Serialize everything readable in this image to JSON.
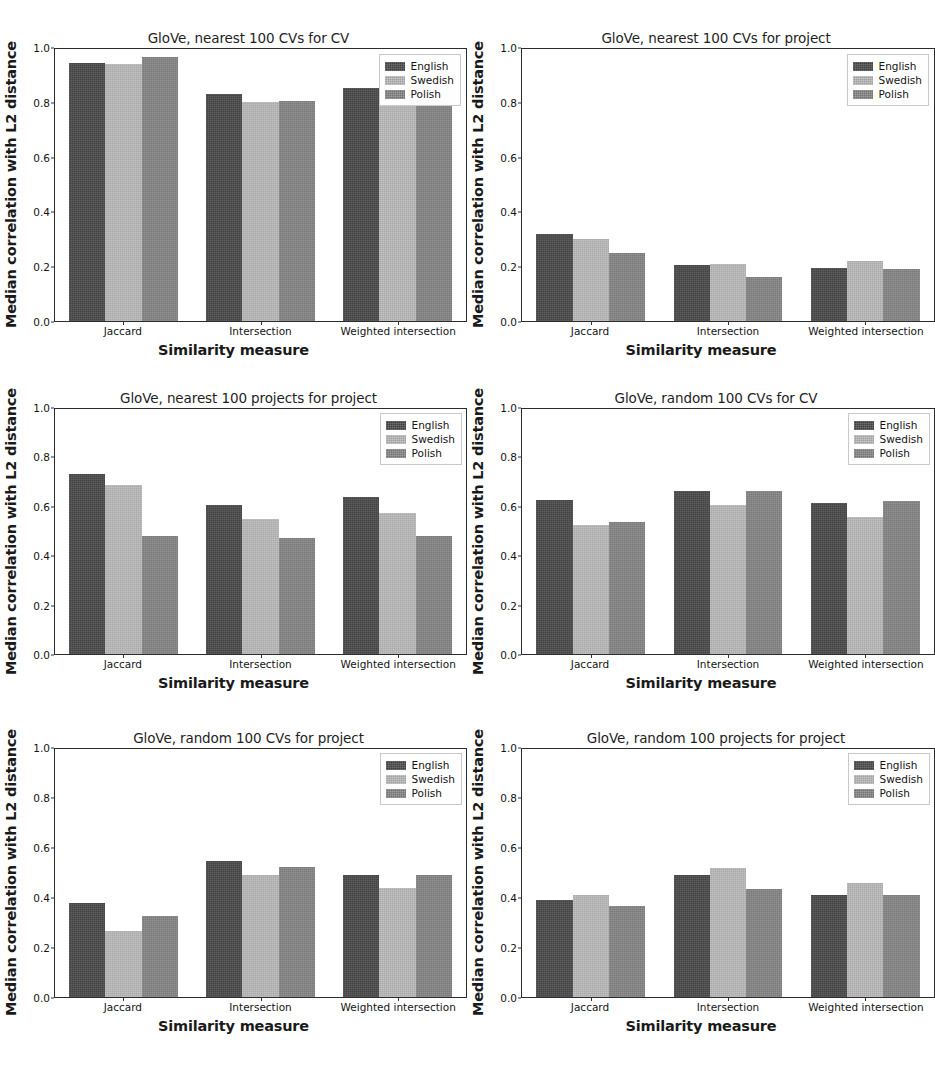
{
  "figure": {
    "shared_ylabel": "Median correlation with L2 distance",
    "shared_xlabel": "Similarity measure",
    "categories": [
      "Jaccard",
      "Intersection",
      "Weighted intersection"
    ],
    "series_names": [
      "English",
      "Swedish",
      "Polish"
    ],
    "yticks": [
      "0.0",
      "0.2",
      "0.4",
      "0.6",
      "0.8",
      "1.0"
    ],
    "colors": {
      "English": "#4a4a4a",
      "Swedish": "#b9b9b9",
      "Polish": "#858585",
      "axis": "#2c2c2c",
      "background": "#ffffff"
    }
  },
  "chart_data": [
    {
      "type": "bar",
      "title": "GloVe, nearest 100 CVs for CV",
      "xlabel": "Similarity measure",
      "ylabel": "Median correlation with L2 distance",
      "categories": [
        "Jaccard",
        "Intersection",
        "Weighted intersection"
      ],
      "series": [
        {
          "name": "English",
          "values": [
            0.95,
            0.835,
            0.855
          ]
        },
        {
          "name": "Swedish",
          "values": [
            0.945,
            0.805,
            0.825
          ]
        },
        {
          "name": "Polish",
          "values": [
            0.97,
            0.81,
            0.83
          ]
        }
      ],
      "ylim": [
        0.0,
        1.0
      ],
      "yticks": [
        0.0,
        0.2,
        0.4,
        0.6,
        0.8,
        1.0
      ],
      "grid": false,
      "legend_position": "upper right"
    },
    {
      "type": "bar",
      "title": "GloVe, nearest 100 CVs for project",
      "xlabel": "Similarity measure",
      "ylabel": "Median correlation with L2 distance",
      "categories": [
        "Jaccard",
        "Intersection",
        "Weighted intersection"
      ],
      "series": [
        {
          "name": "English",
          "values": [
            0.32,
            0.205,
            0.195
          ]
        },
        {
          "name": "Swedish",
          "values": [
            0.3,
            0.21,
            0.22
          ]
        },
        {
          "name": "Polish",
          "values": [
            0.25,
            0.16,
            0.19
          ]
        }
      ],
      "ylim": [
        0.0,
        1.0
      ],
      "yticks": [
        0.0,
        0.2,
        0.4,
        0.6,
        0.8,
        1.0
      ],
      "grid": false,
      "legend_position": "upper right"
    },
    {
      "type": "bar",
      "title": "GloVe, nearest 100 projects for project",
      "xlabel": "Similarity measure",
      "ylabel": "Median correlation with L2 distance",
      "categories": [
        "Jaccard",
        "Intersection",
        "Weighted intersection"
      ],
      "series": [
        {
          "name": "English",
          "values": [
            0.735,
            0.61,
            0.64
          ]
        },
        {
          "name": "Swedish",
          "values": [
            0.69,
            0.55,
            0.575
          ]
        },
        {
          "name": "Polish",
          "values": [
            0.48,
            0.475,
            0.48
          ]
        }
      ],
      "ylim": [
        0.0,
        1.0
      ],
      "yticks": [
        0.0,
        0.2,
        0.4,
        0.6,
        0.8,
        1.0
      ],
      "grid": false,
      "legend_position": "upper right"
    },
    {
      "type": "bar",
      "title": "GloVe, random 100 CVs for CV",
      "xlabel": "Similarity measure",
      "ylabel": "Median correlation with L2 distance",
      "categories": [
        "Jaccard",
        "Intersection",
        "Weighted intersection"
      ],
      "series": [
        {
          "name": "English",
          "values": [
            0.63,
            0.665,
            0.615
          ]
        },
        {
          "name": "Swedish",
          "values": [
            0.525,
            0.61,
            0.56
          ]
        },
        {
          "name": "Polish",
          "values": [
            0.54,
            0.665,
            0.625
          ]
        }
      ],
      "ylim": [
        0.0,
        1.0
      ],
      "yticks": [
        0.0,
        0.2,
        0.4,
        0.6,
        0.8,
        1.0
      ],
      "grid": false,
      "legend_position": "upper right"
    },
    {
      "type": "bar",
      "title": "GloVe, random 100 CVs for project",
      "xlabel": "Similarity measure",
      "ylabel": "Median correlation with L2 distance",
      "categories": [
        "Jaccard",
        "Intersection",
        "Weighted intersection"
      ],
      "series": [
        {
          "name": "English",
          "values": [
            0.38,
            0.55,
            0.49
          ]
        },
        {
          "name": "Swedish",
          "values": [
            0.265,
            0.49,
            0.44
          ]
        },
        {
          "name": "Polish",
          "values": [
            0.325,
            0.525,
            0.49
          ]
        }
      ],
      "ylim": [
        0.0,
        1.0
      ],
      "yticks": [
        0.0,
        0.2,
        0.4,
        0.6,
        0.8,
        1.0
      ],
      "grid": false,
      "legend_position": "upper right"
    },
    {
      "type": "bar",
      "title": "GloVe, random 100 projects for project",
      "xlabel": "Similarity measure",
      "ylabel": "Median correlation with L2 distance",
      "categories": [
        "Jaccard",
        "Intersection",
        "Weighted intersection"
      ],
      "series": [
        {
          "name": "English",
          "values": [
            0.39,
            0.49,
            0.41
          ]
        },
        {
          "name": "Swedish",
          "values": [
            0.41,
            0.52,
            0.46
          ]
        },
        {
          "name": "Polish",
          "values": [
            0.365,
            0.435,
            0.41
          ]
        }
      ],
      "ylim": [
        0.0,
        1.0
      ],
      "yticks": [
        0.0,
        0.2,
        0.4,
        0.6,
        0.8,
        1.0
      ],
      "grid": false,
      "legend_position": "upper right"
    }
  ]
}
